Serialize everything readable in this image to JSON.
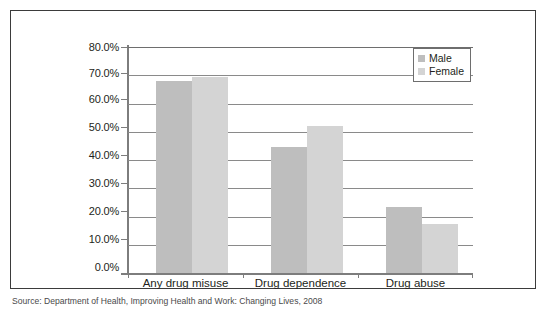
{
  "figure": {
    "caption": "Source: Department of Health, Improving Health and Work: Changing Lives, 2008",
    "frame_color": "#3b3b3b"
  },
  "legend": {
    "position": "top-right",
    "entries": [
      {
        "label": "Male",
        "color": "#bebebe"
      },
      {
        "label": "Female",
        "color": "#d4d4d4"
      }
    ]
  },
  "axis": {
    "y_tick_labels": [
      "80.0%",
      "70.0%",
      "60.0%",
      "50.0%",
      "40.0%",
      "30.0%",
      "20.0%",
      "10.0%",
      "0.0%"
    ],
    "x_tick_labels": [
      "Any drug misuse",
      "Drug dependence",
      "Drug abuse"
    ]
  },
  "chart_data": {
    "type": "bar",
    "title": "",
    "xlabel": "",
    "ylabel": "",
    "ylim": [
      0,
      80
    ],
    "ytick_step": 10,
    "ytick_format": "percent",
    "grid": true,
    "legend_position": "top-right",
    "categories": [
      "Any drug misuse",
      "Drug dependence",
      "Drug abuse"
    ],
    "series": [
      {
        "name": "Male",
        "color": "#bebebe",
        "values": [
          68.0,
          44.5,
          23.5
        ]
      },
      {
        "name": "Female",
        "color": "#d4d4d4",
        "values": [
          69.5,
          52.0,
          17.5
        ]
      }
    ]
  }
}
